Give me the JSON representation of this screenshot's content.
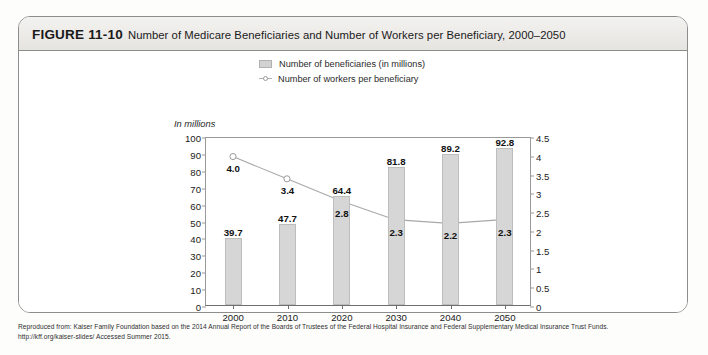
{
  "figure": {
    "label": "FIGURE 11-10",
    "title": "Number of Medicare Beneficiaries and Number of Workers per Beneficiary, 2000–2050"
  },
  "legend": {
    "bars_label": "Number of beneficiaries (in millions)",
    "line_label": "Number of workers per beneficiary"
  },
  "axis": {
    "unit_label": "In millions"
  },
  "source": {
    "line1": "Reproduced from: Kaiser Family Foundation based on the 2014 Annual Report of the Boards of Trustees of the Federal Hospital Insurance and Federal Supplementary Medical Insurance Trust Funds.",
    "line2": "http://kff.org/kaiser-slides/ Accessed Summer 2015."
  },
  "chart_data": {
    "type": "bar",
    "title": "Number of Medicare Beneficiaries and Number of Workers per Beneficiary, 2000–2050",
    "xlabel": "",
    "ylabel": "In millions",
    "categories": [
      "2000",
      "2010",
      "2020",
      "2030",
      "2040",
      "2050"
    ],
    "series": [
      {
        "name": "Number of beneficiaries (in millions)",
        "type": "bar",
        "axis": "left",
        "values": [
          39.7,
          47.7,
          64.4,
          81.8,
          89.2,
          92.8
        ],
        "labels": [
          "39.7",
          "47.7",
          "64.4",
          "81.8",
          "89.2",
          "92.8"
        ],
        "color": "#d6d6d6"
      },
      {
        "name": "Number of workers per beneficiary",
        "type": "line",
        "axis": "right",
        "values": [
          4.0,
          3.4,
          2.8,
          2.3,
          2.2,
          2.3
        ],
        "labels": [
          "4.0",
          "3.4",
          "2.8",
          "2.3",
          "2.2",
          "2.3"
        ],
        "color": "#a8a8a8"
      }
    ],
    "ylim": [
      0,
      100
    ],
    "yticks": [
      "0",
      "10",
      "20",
      "30",
      "40",
      "50",
      "60",
      "70",
      "80",
      "90",
      "100"
    ],
    "y2lim": [
      0,
      4.5
    ],
    "y2ticks": [
      "0",
      "0.5",
      "1",
      "1.5",
      "2",
      "2.5",
      "3",
      "3.5",
      "4",
      "4.5"
    ],
    "grid": false,
    "legend_position": "top-center"
  }
}
